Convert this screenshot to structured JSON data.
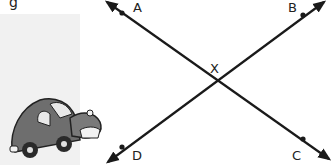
{
  "figure": {
    "type": "intersecting-lines",
    "fragment_text": "g",
    "lines": [
      {
        "name": "line-AC",
        "from": "A",
        "to": "C"
      },
      {
        "name": "line-BD",
        "from": "B",
        "to": "D"
      }
    ],
    "points": {
      "A": {
        "label": "A",
        "x": 122,
        "y": 13
      },
      "B": {
        "label": "B",
        "x": 303,
        "y": 15
      },
      "C": {
        "label": "C",
        "x": 303,
        "y": 139
      },
      "D": {
        "label": "D",
        "x": 122,
        "y": 147
      },
      "X": {
        "label": "X",
        "x": 216,
        "y": 79
      }
    },
    "illustration": "cartoon-car",
    "colors": {
      "line": "#1a1a1a",
      "panel": "#f1f1f1",
      "car_body": "#6e6e6e",
      "car_dark": "#2a2a2a"
    }
  }
}
